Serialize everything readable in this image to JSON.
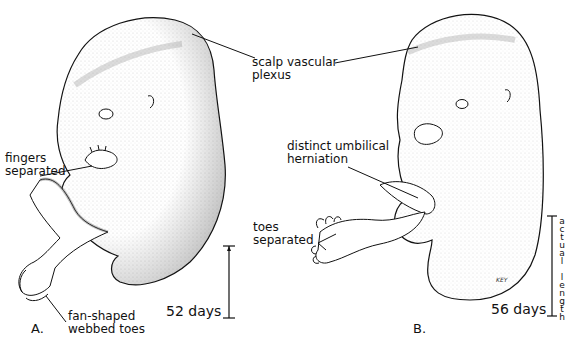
{
  "figure": {
    "panel_a": {
      "letter": "A.",
      "age": "52 days",
      "labels": {
        "fingers": [
          "fingers",
          "separated"
        ],
        "toes": [
          "fan-shaped",
          "webbed toes"
        ]
      }
    },
    "panel_b": {
      "letter": "B.",
      "age": "56 days",
      "labels": {
        "umbilical": [
          "distinct umbilical",
          "herniation"
        ],
        "toes": [
          "toes",
          "separated"
        ]
      },
      "scale_label": "actual length",
      "signature": "KEY"
    },
    "shared_labels": {
      "scalp": [
        "scalp vascular",
        "plexus"
      ]
    },
    "colors": {
      "ink": "#111111",
      "stipple": "#9a9a9a",
      "background": "#ffffff"
    }
  }
}
